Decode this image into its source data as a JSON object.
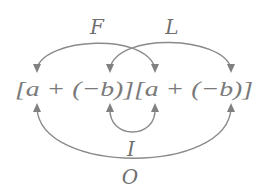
{
  "diagram": {
    "expression": "[a + (−b)][a + (−b)]",
    "arrows": [
      {
        "label": "F",
        "description": "First",
        "from": "top-label",
        "targets": [
          "first a",
          "first a of second factor"
        ]
      },
      {
        "label": "L",
        "description": "Last",
        "targets": [
          "-b of first factor",
          "-b of second factor"
        ]
      },
      {
        "label": "I",
        "description": "Inner",
        "targets": [
          "-b of first factor",
          "a of second factor"
        ]
      },
      {
        "label": "O",
        "description": "Outer",
        "targets": [
          "a of first factor",
          "-b of second factor"
        ]
      }
    ],
    "labels": {
      "F": "F",
      "L": "L",
      "I": "I",
      "O": "O"
    },
    "colors": {
      "stroke": "#8a8a8a",
      "text": "#707070",
      "background": "#ffffff"
    }
  }
}
